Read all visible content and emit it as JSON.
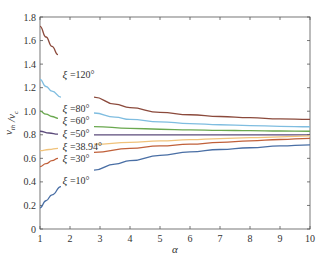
{
  "chart_data": {
    "type": "line",
    "title": "",
    "xlabel": "α",
    "ylabel": "v_th / v_c",
    "xlim": [
      1,
      10
    ],
    "ylim": [
      0,
      1.8
    ],
    "xticks": [
      1,
      2,
      3,
      4,
      5,
      6,
      7,
      8,
      9,
      10
    ],
    "yticks": [
      0,
      0.2,
      0.4,
      0.6,
      0.8,
      1.0,
      1.2,
      1.4,
      1.6,
      1.8
    ],
    "ytick_labels": [
      "0",
      "0.2",
      "0.4",
      "0.6",
      "0.8",
      "1.0",
      "1.2",
      "1.4",
      "1.6",
      "1.8"
    ],
    "grid": false,
    "legend": "inline labels",
    "series": [
      {
        "name": "ξ =120°",
        "color": "#8b4a3c",
        "segments": [
          {
            "x": [
              1,
              1.2,
              1.4,
              1.6
            ],
            "y": [
              1.72,
              1.63,
              1.55,
              1.48
            ]
          },
          {
            "x": [
              2.8,
              3.5,
              4,
              5,
              6,
              7,
              8,
              9,
              10
            ],
            "y": [
              1.12,
              1.06,
              1.03,
              0.99,
              0.97,
              0.955,
              0.945,
              0.935,
              0.93
            ]
          }
        ],
        "label_pos": {
          "x": 1.75,
          "y": 1.31
        }
      },
      {
        "name": "ξ =80°",
        "color": "#7fbde0",
        "segments": [
          {
            "x": [
              1,
              1.2,
              1.4,
              1.7
            ],
            "y": [
              1.27,
              1.21,
              1.17,
              1.12
            ]
          },
          {
            "x": [
              2.8,
              3.5,
              4,
              5,
              6,
              7,
              8,
              9,
              10
            ],
            "y": [
              0.985,
              0.95,
              0.93,
              0.91,
              0.895,
              0.885,
              0.878,
              0.872,
              0.868
            ]
          }
        ],
        "label_pos": {
          "x": 1.75,
          "y": 1.02
        }
      },
      {
        "name": "ξ =60°",
        "color": "#6aa84f",
        "segments": [
          {
            "x": [
              1,
              1.2,
              1.4,
              1.6
            ],
            "y": [
              1.0,
              0.975,
              0.955,
              0.94
            ]
          },
          {
            "x": [
              2.8,
              4,
              5,
              6,
              7,
              8,
              9,
              10
            ],
            "y": [
              0.87,
              0.855,
              0.847,
              0.842,
              0.838,
              0.835,
              0.832,
              0.83
            ]
          }
        ],
        "label_pos": {
          "x": 1.75,
          "y": 0.92
        }
      },
      {
        "name": "ξ =50°",
        "color": "#5b4a7a",
        "segments": [
          {
            "x": [
              1,
              1.3,
              1.6
            ],
            "y": [
              0.83,
              0.815,
              0.805
            ]
          },
          {
            "x": [
              2.8,
              5,
              7,
              10
            ],
            "y": [
              0.8,
              0.8,
              0.8,
              0.8
            ]
          }
        ],
        "label_pos": {
          "x": 1.75,
          "y": 0.81
        }
      },
      {
        "name": "ξ =38.94°",
        "color": "#f0c27a",
        "segments": [
          {
            "x": [
              1,
              1.3,
              1.6
            ],
            "y": [
              0.665,
              0.675,
              0.685
            ]
          },
          {
            "x": [
              2.8,
              4,
              5,
              6,
              7,
              8,
              9,
              10
            ],
            "y": [
              0.72,
              0.735,
              0.748,
              0.758,
              0.767,
              0.775,
              0.782,
              0.79
            ]
          }
        ],
        "label_pos": {
          "x": 1.75,
          "y": 0.7
        }
      },
      {
        "name": "ξ =30°",
        "color": "#c0603a",
        "segments": [
          {
            "x": [
              1,
              1.2,
              1.4,
              1.6
            ],
            "y": [
              0.53,
              0.555,
              0.58,
              0.6
            ]
          },
          {
            "x": [
              2.8,
              4,
              5,
              6,
              7,
              8,
              9,
              10
            ],
            "y": [
              0.65,
              0.685,
              0.705,
              0.72,
              0.735,
              0.748,
              0.76,
              0.77
            ]
          }
        ],
        "label_pos": {
          "x": 1.75,
          "y": 0.6
        }
      },
      {
        "name": "ξ =10°",
        "color": "#4a6fa5",
        "segments": [
          {
            "x": [
              1,
              1.2,
              1.4,
              1.7
            ],
            "y": [
              0.18,
              0.24,
              0.29,
              0.36
            ]
          },
          {
            "x": [
              2.8,
              3.5,
              4,
              5,
              6,
              7,
              8,
              9,
              10
            ],
            "y": [
              0.5,
              0.55,
              0.58,
              0.625,
              0.655,
              0.675,
              0.69,
              0.705,
              0.715
            ]
          }
        ],
        "label_pos": {
          "x": 1.75,
          "y": 0.41
        }
      }
    ]
  },
  "plot": {
    "left": 40,
    "top": 17,
    "right": 310,
    "bottom": 229,
    "axis_color": "#555555"
  }
}
